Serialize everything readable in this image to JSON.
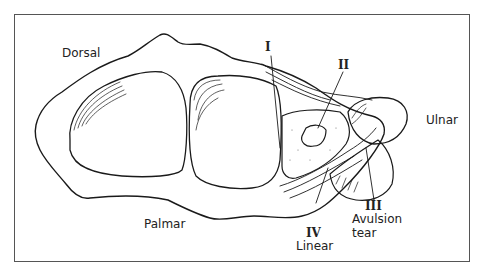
{
  "figure": {
    "labels": {
      "dorsal": "Dorsal",
      "palmar": "Palmar",
      "ulnar": "Ulnar"
    },
    "tears": [
      {
        "numeral": "I",
        "description": ""
      },
      {
        "numeral": "II",
        "description": ""
      },
      {
        "numeral": "III",
        "description_line1": "Avulsion",
        "description_line2": "tear"
      },
      {
        "numeral": "IV",
        "description": "Linear"
      }
    ]
  }
}
